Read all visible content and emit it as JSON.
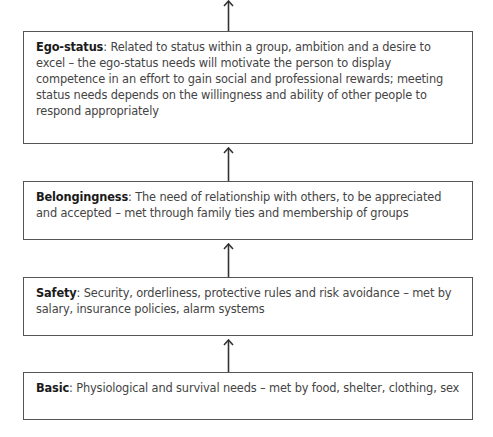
{
  "diagram": {
    "type": "hierarchy-of-needs",
    "levels": [
      {
        "id": "ego-status",
        "title": "Ego-status",
        "description": ": Related to status within a group, ambition and a desire to excel – the ego-status needs will motivate the person to display competence in an effort to gain social and professional rewards; meeting status needs depends on the willingness and ability of other people to respond appropriately"
      },
      {
        "id": "belongingness",
        "title": "Belongingness",
        "description": ": The need of relationship with others, to be appreciated and accepted – met through family ties and membership of groups"
      },
      {
        "id": "safety",
        "title": "Safety",
        "description": ": Security, orderliness, protective rules and risk avoidance – met by salary, insurance policies, alarm systems"
      },
      {
        "id": "basic",
        "title": "Basic",
        "description": ": Physiological and survival needs – met by food, shelter, clothing, sex"
      }
    ],
    "colors": {
      "border": "#555555",
      "arrow": "#333333",
      "title_text": "#1a1a1a",
      "body_text": "#444444"
    }
  }
}
